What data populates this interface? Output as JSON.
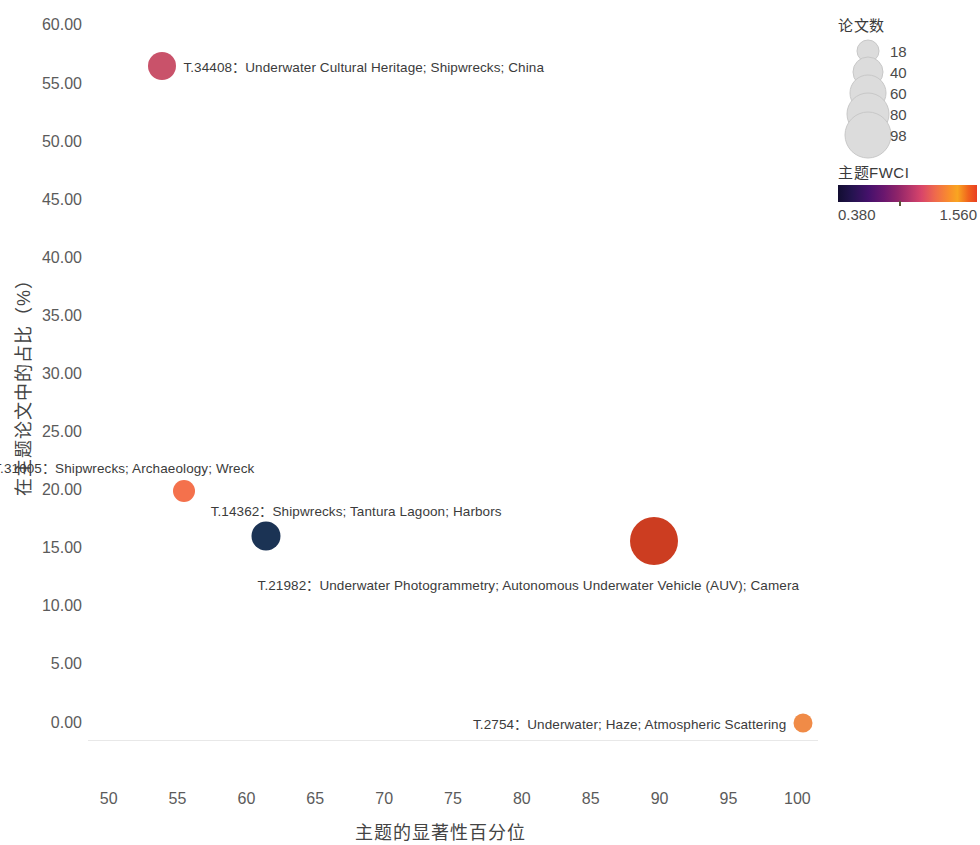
{
  "chart_data": {
    "type": "scatter",
    "title": "",
    "xlabel": "主题的显著性百分位",
    "ylabel": "在主题论文中的占比（%）",
    "xlim": [
      48.5,
      101.5
    ],
    "ylim": [
      -1.5,
      61.5
    ],
    "xticks": [
      50,
      55,
      60,
      65,
      70,
      75,
      80,
      85,
      90,
      95,
      100
    ],
    "yticks": [
      "0.00",
      "5.00",
      "10.00",
      "15.00",
      "20.00",
      "25.00",
      "30.00",
      "35.00",
      "40.00",
      "45.00",
      "50.00",
      "55.00",
      "60.00"
    ],
    "ytick_values": [
      0,
      5,
      10,
      15,
      20,
      25,
      30,
      35,
      40,
      45,
      50,
      55,
      60
    ],
    "grid": false,
    "legend_position": "right",
    "points": [
      {
        "id": "T.34408",
        "label": "T.34408：Underwater Cultural Heritage; Shipwrecks; China",
        "x": 53.9,
        "y": 56.5,
        "size": 28,
        "color": "#c9526a",
        "label_side": "right"
      },
      {
        "id": "T.31005",
        "label": "T.31005：Shipwrecks; Archaeology; Wreck",
        "x": 55.5,
        "y": 19.9,
        "size": 22,
        "color": "#f4714c",
        "label_side": "left-above"
      },
      {
        "id": "T.14362",
        "label": "T.14362：Shipwrecks; Tantura Lagoon; Harbors",
        "x": 61.4,
        "y": 16.1,
        "size": 29,
        "color": "#1b3354",
        "label_side": "right-above"
      },
      {
        "id": "T.21982",
        "label": "T.21982：Underwater Photogrammetry; Autonomous Underwater Vehicle (AUV); Camera",
        "x": 89.6,
        "y": 15.6,
        "size": 48,
        "color": "#cc3d21",
        "label_side": "below"
      },
      {
        "id": "T.2754",
        "label": "T.2754：Underwater; Haze; Atmospheric Scattering",
        "x": 100.4,
        "y": 0.0,
        "size": 19,
        "color": "#f08b47",
        "label_side": "left"
      }
    ],
    "size_legend": {
      "title": "论文数",
      "entries": [
        {
          "value": "18",
          "diameter": 21
        },
        {
          "value": "40",
          "diameter": 29
        },
        {
          "value": "60",
          "diameter": 35
        },
        {
          "value": "80",
          "diameter": 41
        },
        {
          "value": "98",
          "diameter": 45
        }
      ]
    },
    "color_legend": {
      "title": "主题FWCI",
      "min": "0.380",
      "max": "1.560",
      "colormap": "inferno"
    }
  }
}
